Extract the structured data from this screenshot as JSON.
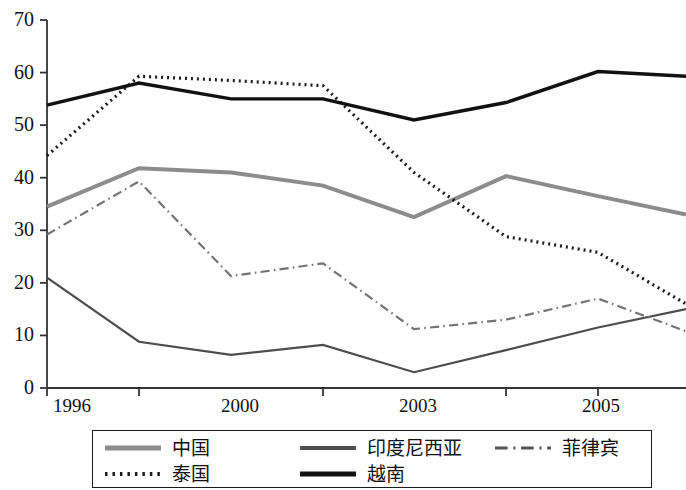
{
  "chart_data": {
    "type": "line",
    "title": "",
    "subtitle": "",
    "xlabel": "",
    "ylabel": "",
    "xlim": [
      1996,
      2007
    ],
    "ylim": [
      0,
      70
    ],
    "grid": false,
    "legend_position": "bottom",
    "y_ticks": [
      0,
      10,
      20,
      30,
      40,
      50,
      60,
      70
    ],
    "x_tick_labels": [
      "1996",
      "2000",
      "2003",
      "2005"
    ],
    "x_tick_values": [
      1996,
      2000,
      2003,
      2005
    ],
    "x": [
      1996,
      1997,
      1998,
      1999,
      2000,
      2001,
      2002,
      2003
    ],
    "x_positions_px": [
      47,
      139,
      231,
      323,
      414,
      506,
      598,
      686
    ],
    "series": [
      {
        "name": "中国",
        "style": "solid",
        "color": "#8c8c8c",
        "width": 4,
        "values": [
          34.5,
          41.8,
          41.0,
          38.5,
          32.5,
          40.3,
          36.5,
          33.0
        ]
      },
      {
        "name": "印度尼西亚",
        "style": "solid",
        "color": "#4d4d4d",
        "width": 2.2,
        "values": [
          21.0,
          8.8,
          6.3,
          8.2,
          3.0,
          7.2,
          11.5,
          15.0
        ]
      },
      {
        "name": "菲律宾",
        "style": "dashdot",
        "color": "#737373",
        "width": 2.2,
        "values": [
          29.2,
          39.3,
          21.3,
          23.7,
          11.2,
          13.0,
          17.0,
          10.8
        ]
      },
      {
        "name": "泰国",
        "style": "dotted",
        "color": "#1a1a1a",
        "width": 3.2,
        "values": [
          44.2,
          59.3,
          58.5,
          57.5,
          41.0,
          28.8,
          25.8,
          16.0
        ]
      },
      {
        "name": "越南",
        "style": "solid",
        "color": "#111111",
        "width": 3.4,
        "values": [
          53.8,
          58.0,
          55.0,
          55.0,
          51.0,
          54.3,
          60.2,
          59.3
        ]
      }
    ]
  },
  "legend": {
    "entries": [
      {
        "label": "中国",
        "style": "solid",
        "color": "#8c8c8c",
        "width": 5
      },
      {
        "label": "印度尼西亚",
        "style": "solid",
        "color": "#4d4d4d",
        "width": 4
      },
      {
        "label": "菲律宾",
        "style": "dashdot",
        "color": "#555555",
        "width": 3
      },
      {
        "label": "泰国",
        "style": "dotted",
        "color": "#1a1a1a",
        "width": 4
      },
      {
        "label": "越南",
        "style": "solid",
        "color": "#111111",
        "width": 5
      }
    ]
  }
}
